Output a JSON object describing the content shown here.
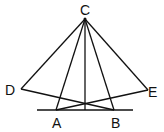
{
  "diagram": {
    "type": "geometry",
    "points": {
      "C": {
        "label": "C",
        "x": 85,
        "y": 19
      },
      "D": {
        "label": "D",
        "x": 21,
        "y": 89
      },
      "E": {
        "label": "E",
        "x": 148,
        "y": 90
      },
      "A": {
        "label": "A",
        "x": 56,
        "y": 110
      },
      "B": {
        "label": "B",
        "x": 114,
        "y": 110
      }
    },
    "segments": [
      [
        "C",
        "D"
      ],
      [
        "C",
        "E"
      ],
      [
        "C",
        "A"
      ],
      [
        "C",
        "B"
      ],
      [
        "D",
        "B"
      ],
      [
        "E",
        "A"
      ],
      [
        "C",
        "foot"
      ]
    ],
    "baseline": {
      "x1": 37,
      "x2": 133,
      "y": 110
    },
    "labels": {
      "C": "C",
      "D": "D",
      "E": "E",
      "A": "A",
      "B": "B"
    },
    "stroke_color": "#111111"
  }
}
